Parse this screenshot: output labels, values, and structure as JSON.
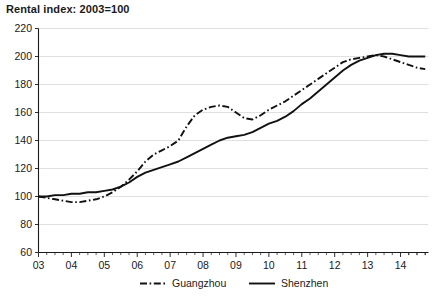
{
  "chart_data": {
    "type": "line",
    "title": "Rental index: 2003=100",
    "xlabel": "",
    "ylabel": "",
    "ylim": [
      60,
      220
    ],
    "ytick_labels": [
      "60",
      "80",
      "100",
      "120",
      "140",
      "160",
      "180",
      "200",
      "220"
    ],
    "ytick_values": [
      60,
      80,
      100,
      120,
      140,
      160,
      180,
      200,
      220
    ],
    "xtick_labels": [
      "03",
      "04",
      "05",
      "06",
      "07",
      "08",
      "09",
      "10",
      "11",
      "12",
      "13",
      "14"
    ],
    "xtick_values": [
      2003,
      2004,
      2005,
      2006,
      2007,
      2008,
      2009,
      2010,
      2011,
      2012,
      2013,
      2014
    ],
    "xlim": [
      2003,
      2014.85
    ],
    "minor_ticks_per_interval": 4,
    "grid": "horizontal",
    "legend_position": "bottom-center",
    "x": [
      2003.0,
      2003.25,
      2003.5,
      2003.75,
      2004.0,
      2004.25,
      2004.5,
      2004.75,
      2005.0,
      2005.25,
      2005.5,
      2005.75,
      2006.0,
      2006.25,
      2006.5,
      2006.75,
      2007.0,
      2007.25,
      2007.5,
      2007.75,
      2008.0,
      2008.25,
      2008.5,
      2008.75,
      2009.0,
      2009.25,
      2009.5,
      2009.75,
      2010.0,
      2010.25,
      2010.5,
      2010.75,
      2011.0,
      2011.25,
      2011.5,
      2011.75,
      2012.0,
      2012.25,
      2012.5,
      2012.75,
      2013.0,
      2013.25,
      2013.5,
      2013.75,
      2014.0,
      2014.25,
      2014.5,
      2014.75
    ],
    "series": [
      {
        "name": "Guangzhou",
        "style": "dash-dot",
        "color": "#111111",
        "values": [
          100,
          99,
          98,
          97,
          96,
          96,
          97,
          98,
          100,
          103,
          107,
          112,
          118,
          125,
          130,
          133,
          136,
          140,
          150,
          158,
          162,
          164,
          165,
          164,
          160,
          156,
          155,
          158,
          162,
          165,
          168,
          172,
          176,
          180,
          184,
          188,
          192,
          196,
          198,
          199,
          200,
          201,
          200,
          198,
          196,
          194,
          192,
          191
        ]
      },
      {
        "name": "Shenzhen",
        "style": "solid",
        "color": "#111111",
        "values": [
          100,
          100,
          101,
          101,
          102,
          102,
          103,
          103,
          104,
          105,
          107,
          110,
          114,
          117,
          119,
          121,
          123,
          125,
          128,
          131,
          134,
          137,
          140,
          142,
          143,
          144,
          146,
          149,
          152,
          154,
          157,
          161,
          166,
          170,
          175,
          180,
          185,
          190,
          194,
          197,
          199,
          201,
          202,
          202,
          201,
          200,
          200,
          200
        ]
      }
    ]
  },
  "legend": {
    "items": [
      {
        "label": "Guangzhou",
        "style": "dash-dot"
      },
      {
        "label": "Shenzhen",
        "style": "solid"
      }
    ]
  }
}
